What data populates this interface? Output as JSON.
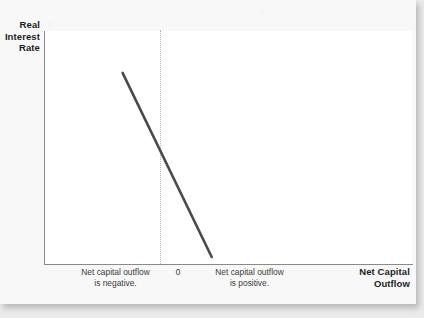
{
  "figure": {
    "background_color": "#f8f8f8",
    "plot_background_color": "#ffffff",
    "axis_color": "#8a8a8a",
    "curve_color": "#4a4a4a",
    "zero_line_color": "#b8b8b8"
  },
  "axes": {
    "y_title": "Real\nInterest\nRate",
    "y_title_lines": [
      "Real",
      "Interest",
      "Rate"
    ],
    "x_title": "Net Capital\nOutflow",
    "x_title_lines": [
      "Net Capital",
      "Outflow"
    ],
    "zero_tick_label": "0"
  },
  "annotations": {
    "left_note": "Net capital outflow\nis negative.",
    "left_note_lines": [
      "Net capital outflow",
      "is negative."
    ],
    "right_note": "Net capital outflow\nis positive.",
    "right_note_lines": [
      "Net capital outflow",
      "is positive."
    ]
  },
  "chart_data": {
    "type": "line",
    "title": "",
    "subtitle": "",
    "xlabel": "Net Capital Outflow",
    "ylabel": "Real Interest Rate",
    "grid": false,
    "legend": null,
    "axis_ticks": {
      "x": [
        "0"
      ],
      "y": []
    },
    "axis_ranges": {
      "x": [
        -1,
        2.17
      ],
      "y": [
        0,
        1
      ]
    },
    "series": [
      {
        "name": "Net capital outflow curve",
        "type": "line",
        "color": "#4a4a4a",
        "linewidth": 2.6,
        "points": [
          {
            "x": -0.33,
            "y": 0.82
          },
          {
            "x": 0.0,
            "y": 0.455
          },
          {
            "x": 0.44,
            "y": 0.03
          }
        ],
        "slope_direction": "downward",
        "description": "Downward-sloping net capital outflow curve crossing zero at a positive real interest rate"
      }
    ],
    "reference_lines": [
      {
        "name": "zero-vertical",
        "orientation": "vertical",
        "value": 0,
        "style": "dotted",
        "color": "#b8b8b8"
      }
    ],
    "annotations": [
      {
        "text": "Net capital outflow is negative.",
        "x": -0.58,
        "position": "below-axis-left"
      },
      {
        "text": "0",
        "x": 0,
        "position": "below-axis-center"
      },
      {
        "text": "Net capital outflow is positive.",
        "x": 0.59,
        "position": "below-axis-right"
      }
    ]
  }
}
